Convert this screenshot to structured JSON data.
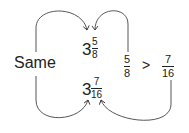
{
  "labels": {
    "same": "Same",
    "gt": ">"
  },
  "mixed_top": {
    "whole": "3",
    "numerator": "5",
    "denominator": "8"
  },
  "mixed_bottom": {
    "whole": "3",
    "numerator": "7",
    "denominator": "16"
  },
  "compare_left": {
    "numerator": "5",
    "denominator": "8"
  },
  "compare_right": {
    "numerator": "7",
    "denominator": "16"
  },
  "colors": {
    "ink": "#222222",
    "background": "#ffffff"
  }
}
